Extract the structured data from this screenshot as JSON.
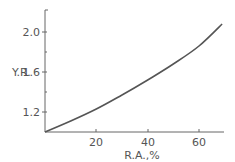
{
  "chart_data": {
    "type": "line",
    "title": "",
    "xlabel": "R.A.,%",
    "ylabel": "Y.R.",
    "xlim": [
      0,
      70
    ],
    "ylim": [
      1.0,
      2.2
    ],
    "x_ticks": [
      20,
      40,
      60
    ],
    "x_tick_labels": [
      "20",
      "40",
      "60"
    ],
    "y_ticks": [
      1.2,
      1.6,
      2.0
    ],
    "y_tick_labels": [
      "1.2",
      "1.6",
      "2.0"
    ],
    "y_minor_ticks": [
      1.4,
      1.8
    ],
    "grid": false,
    "legend": null,
    "series": [
      {
        "name": "Y.R.",
        "x": [
          0,
          10,
          20,
          30,
          40,
          50,
          60,
          69
        ],
        "y": [
          1.0,
          1.11,
          1.23,
          1.37,
          1.52,
          1.68,
          1.86,
          2.08
        ]
      }
    ]
  },
  "labels": {
    "ylabel": "Y.R.",
    "xlabel": "R.A.,%",
    "yticks": [
      "2.0",
      "1.6",
      "1.2"
    ],
    "xticks": [
      "20",
      "40",
      "60"
    ]
  }
}
